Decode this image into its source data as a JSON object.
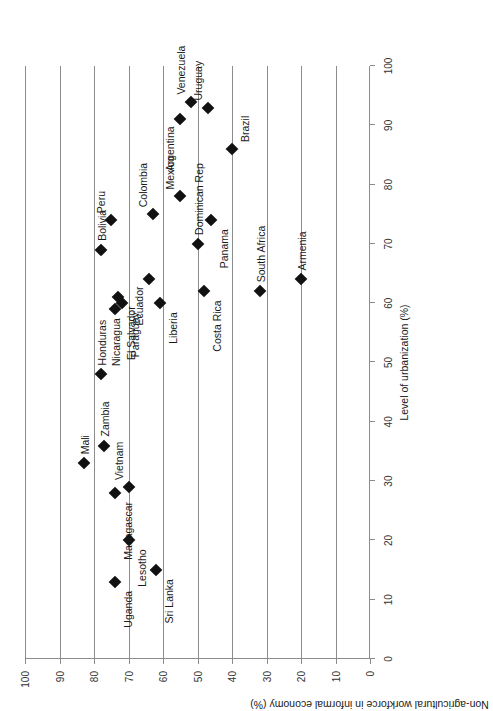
{
  "chart_data": {
    "type": "scatter",
    "title": "",
    "xlabel": "Level of urbanization (%)",
    "ylabel": "Non-agricultural workforce in informal economy (%)",
    "xlim": [
      0,
      100
    ],
    "ylim": [
      0,
      100
    ],
    "xticks": [
      0,
      10,
      20,
      30,
      40,
      50,
      60,
      70,
      80,
      90,
      100
    ],
    "yticks": [
      0,
      10,
      20,
      30,
      40,
      50,
      60,
      70,
      80,
      90,
      100
    ],
    "grid": "horizontal-on-y-ticks",
    "legend": "none",
    "marker": "filled-diamond",
    "marker_color": "#111111",
    "rotation_deg": -90,
    "points": [
      {
        "label": "Uganda",
        "x": 13,
        "y": 74,
        "label_pos": "below-left"
      },
      {
        "label": "Sri Lanka",
        "x": 15,
        "y": 62,
        "label_pos": "below-left"
      },
      {
        "label": "Lesotho",
        "x": 20,
        "y": 70,
        "label_pos": "below-left"
      },
      {
        "label": "Madagascar",
        "x": 28,
        "y": 74,
        "label_pos": "below-left"
      },
      {
        "label": "Vietnam",
        "x": 29,
        "y": 70,
        "label_pos": "above-right"
      },
      {
        "label": "Mali",
        "x": 33,
        "y": 83,
        "label_pos": "right"
      },
      {
        "label": "Zambia",
        "x": 36,
        "y": 77,
        "label_pos": "right"
      },
      {
        "label": "Honduras",
        "x": 48,
        "y": 78,
        "label_pos": "right"
      },
      {
        "label": "Nicaragua",
        "x": 59,
        "y": 74,
        "label_pos": "left"
      },
      {
        "label": "Liberia",
        "x": 60,
        "y": 61,
        "label_pos": "below-left"
      },
      {
        "label": "Costa Rica",
        "x": 62,
        "y": 48,
        "label_pos": "below-left"
      },
      {
        "label": "El Salvador",
        "x": 61,
        "y": 73,
        "label_pos": "below-left"
      },
      {
        "label": "South Africa",
        "x": 62,
        "y": 32,
        "label_pos": "right"
      },
      {
        "label": "Armenia",
        "x": 64,
        "y": 20,
        "label_pos": "right"
      },
      {
        "label": "Ecuador",
        "x": 64,
        "y": 64,
        "label_pos": "above-left"
      },
      {
        "label": "Paraguay",
        "x": 60,
        "y": 72,
        "label_pos": "below-left"
      },
      {
        "label": "Dominican Rep",
        "x": 70,
        "y": 50,
        "label_pos": "right"
      },
      {
        "label": "Bolivia",
        "x": 69,
        "y": 78,
        "label_pos": "right"
      },
      {
        "label": "Panama",
        "x": 74,
        "y": 46,
        "label_pos": "below-left"
      },
      {
        "label": "Colombia",
        "x": 75,
        "y": 63,
        "label_pos": "above-right"
      },
      {
        "label": "Peru",
        "x": 74,
        "y": 75,
        "label_pos": "above-right"
      },
      {
        "label": "Mexico",
        "x": 78,
        "y": 55,
        "label_pos": "above-right"
      },
      {
        "label": "Brazil",
        "x": 86,
        "y": 40,
        "label_pos": "below-right"
      },
      {
        "label": "Uruguay",
        "x": 93,
        "y": 47,
        "label_pos": "above-right"
      },
      {
        "label": "Venezuela",
        "x": 94,
        "y": 52,
        "label_pos": "above-right"
      },
      {
        "label": "Argentina",
        "x": 91,
        "y": 55,
        "label_pos": "above-left"
      }
    ]
  }
}
